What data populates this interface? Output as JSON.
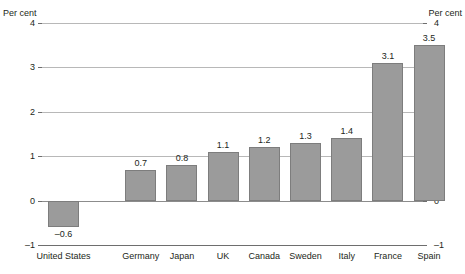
{
  "axis": {
    "unit_left": "Per cent",
    "unit_right": "Per cent",
    "ticks": [
      "4",
      "3",
      "2",
      "1",
      "0",
      "–1"
    ]
  },
  "chart_data": {
    "type": "bar",
    "title": "",
    "xlabel": "",
    "ylabel": "Per cent",
    "ylim": [
      -1,
      4
    ],
    "yticks": [
      -1,
      0,
      1,
      2,
      3,
      4
    ],
    "ytick_labels": [
      "–1",
      "0",
      "1",
      "2",
      "3",
      "4"
    ],
    "grid": true,
    "legend": false,
    "categories": [
      "United States",
      "Germany",
      "Japan",
      "UK",
      "Canada",
      "Sweden",
      "Italy",
      "France",
      "Spain"
    ],
    "values": [
      -0.6,
      0.7,
      0.8,
      1.1,
      1.2,
      1.3,
      1.4,
      3.1,
      3.5
    ],
    "value_labels": [
      "–0.6",
      "0.7",
      "0.8",
      "1.1",
      "1.2",
      "1.3",
      "1.4",
      "3.1",
      "3.5"
    ],
    "series": [
      {
        "name": "",
        "values": [
          -0.6,
          0.7,
          0.8,
          1.1,
          1.2,
          1.3,
          1.4,
          3.1,
          3.5
        ]
      }
    ],
    "bar_color": "#9b9b9b",
    "bar_border_color": "#7d7d7d"
  }
}
